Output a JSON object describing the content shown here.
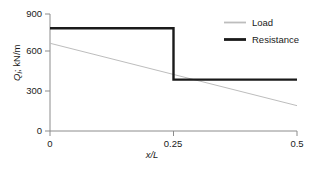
{
  "chart_data": {
    "type": "line",
    "title": "",
    "xlabel": "x/L",
    "ylabel": "Qi; kN/m",
    "ylabel_base": "Q",
    "ylabel_sub": "i",
    "ylabel_rest": "; kN/m",
    "xlim": [
      0,
      0.5
    ],
    "ylim": [
      0,
      900
    ],
    "grid": false,
    "legend_position": "top-right",
    "xticks": [
      0,
      0.25,
      0.5
    ],
    "xtick_labels": [
      "0",
      "0.25",
      "0.5"
    ],
    "yticks": [
      0,
      300,
      600,
      900
    ],
    "ytick_labels": [
      "0",
      "300",
      "600",
      "900"
    ],
    "series": [
      {
        "name": "Load",
        "color": "#bdbdbd",
        "width": 1,
        "style": "linear",
        "x": [
          0,
          0.5
        ],
        "values": [
          675,
          195
        ]
      },
      {
        "name": "Resistance",
        "color": "#1a1a1a",
        "width": 2.4,
        "style": "step",
        "x": [
          0,
          0.25,
          0.25,
          0.5
        ],
        "values": [
          790,
          790,
          395,
          395
        ]
      }
    ],
    "annotations": {
      "step_location": 0.25,
      "resistance_high": 790,
      "resistance_low": 395,
      "load_start": 675,
      "load_end": 195
    }
  },
  "legend": {
    "items": [
      {
        "label": "Load",
        "color": "#bdbdbd",
        "width": 1.6
      },
      {
        "label": "Resistance",
        "color": "#1a1a1a",
        "width": 2.6
      }
    ]
  },
  "axes": {
    "axis_color": "#8c8c8c",
    "ytick_positions_px": [
      131,
      91,
      51,
      14
    ],
    "xtick_positions_px": [
      50,
      173.5,
      297
    ]
  }
}
